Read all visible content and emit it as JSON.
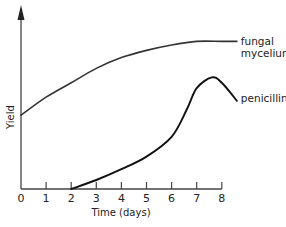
{
  "chart_data": {
    "type": "line",
    "title": "",
    "xlabel": "Time (days)",
    "ylabel": "Yield",
    "x_ticks": [
      0,
      1,
      2,
      3,
      4,
      5,
      6,
      7,
      8
    ],
    "xlim": [
      0,
      8.8
    ],
    "ylim": [
      0,
      100
    ],
    "y_ticks": [],
    "grid": false,
    "legend": "inline labels at line ends",
    "series": [
      {
        "name": "fungal mycelium",
        "label_lines": [
          "fungal",
          "mycelium"
        ],
        "color": "#333333",
        "x": [
          0,
          1,
          2,
          3,
          4,
          5,
          6,
          7,
          8,
          8.6
        ],
        "y": [
          41,
          51,
          59,
          67,
          73,
          77,
          80,
          82,
          82,
          82
        ]
      },
      {
        "name": "penicillin",
        "label_lines": [
          "penicillin"
        ],
        "color": "#111111",
        "x": [
          2,
          3,
          4,
          5,
          6,
          6.6,
          7,
          7.6,
          8,
          8.6
        ],
        "y": [
          0,
          5,
          11,
          18,
          29,
          44,
          56,
          62,
          59,
          49
        ]
      }
    ]
  }
}
